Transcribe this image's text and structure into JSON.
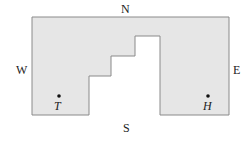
{
  "compass": {
    "north": "N",
    "south": "S",
    "east": "E",
    "west": "W"
  },
  "points": [
    {
      "label": "T",
      "x": 59,
      "y": 96
    },
    {
      "label": "H",
      "x": 208,
      "y": 96
    }
  ],
  "shape": {
    "fill": "#e6e6e6",
    "stroke": "#8a8a8a",
    "outline": [
      [
        32,
        17
      ],
      [
        229,
        17
      ],
      [
        229,
        115
      ],
      [
        160,
        115
      ],
      [
        160,
        36
      ],
      [
        135,
        36
      ],
      [
        135,
        56
      ],
      [
        111,
        56
      ],
      [
        111,
        76
      ],
      [
        89,
        76
      ],
      [
        89,
        115
      ],
      [
        32,
        115
      ]
    ]
  }
}
